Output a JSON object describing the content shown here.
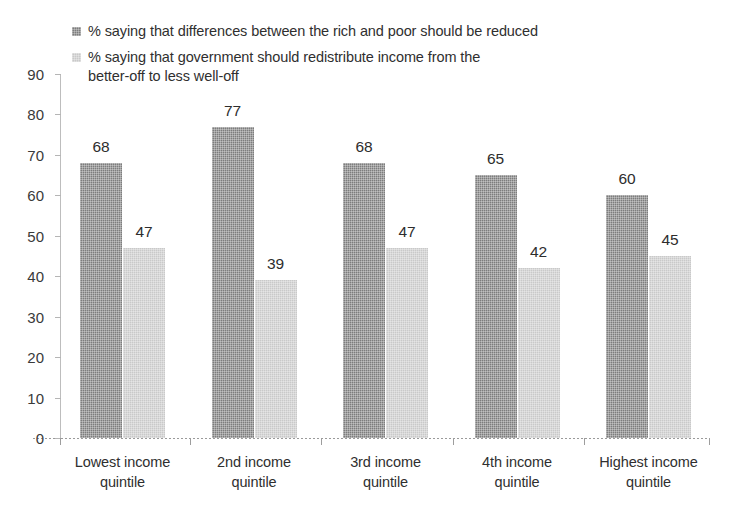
{
  "chart_data": {
    "type": "bar",
    "title": "",
    "subtitle": "",
    "xlabel": "",
    "ylabel": "",
    "ylim": [
      0,
      90
    ],
    "ytick_step": 10,
    "yticks": [
      "0",
      "10",
      "20",
      "30",
      "40",
      "50",
      "60",
      "70",
      "80",
      "90"
    ],
    "grid": false,
    "legend_position": "top",
    "categories": [
      "Lowest income\nquintile",
      "2nd income\nquintile",
      "3rd income\nquintile",
      "4th income\nquintile",
      "Highest income\nquintile"
    ],
    "series": [
      {
        "name": "% saying that differences between the rich and poor should be reduced",
        "color": "#7d7d7d",
        "values": [
          68,
          77,
          68,
          65,
          60
        ],
        "labels": [
          "68",
          "77",
          "68",
          "65",
          "60"
        ]
      },
      {
        "name": "% saying that government should redistribute income from the\nbetter-off to less well-off",
        "color": "#c9c9c9",
        "values": [
          47,
          39,
          47,
          42,
          45
        ],
        "labels": [
          "47",
          "39",
          "47",
          "42",
          "45"
        ]
      }
    ]
  },
  "legend": {
    "items": [
      {
        "label": "% saying that differences between the rich and poor should be reduced",
        "swatch_color": "#7d7d7d",
        "swatch_name": "legend-swatch-dark"
      },
      {
        "label": "% saying that government should redistribute income from the\nbetter-off to less well-off",
        "swatch_color": "#c9c9c9",
        "swatch_name": "legend-swatch-light"
      }
    ]
  },
  "axes": {
    "y_axis_color": "#bdbdbd",
    "x_axis_color": "#9a9a9a",
    "tick_label_color": "#3a3a3a"
  }
}
